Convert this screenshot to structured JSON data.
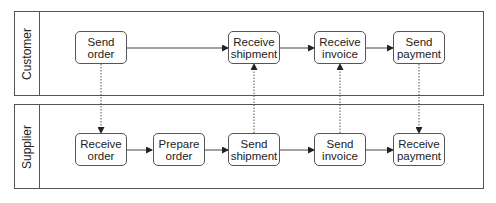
{
  "pools": [
    {
      "label": "Customer",
      "tasks": [
        {
          "line1": "Send",
          "line2": "order"
        },
        {
          "line1": "Receive",
          "line2": "shipment"
        },
        {
          "line1": "Receive",
          "line2": "invoice"
        },
        {
          "line1": "Send",
          "line2": "payment"
        }
      ]
    },
    {
      "label": "Supplier",
      "tasks": [
        {
          "line1": "Receive",
          "line2": "order"
        },
        {
          "line1": "Prepare",
          "line2": "order"
        },
        {
          "line1": "Send",
          "line2": "shipment"
        },
        {
          "line1": "Send",
          "line2": "invoice"
        },
        {
          "line1": "Receive",
          "line2": "payment"
        }
      ]
    }
  ],
  "sequence_flows": [
    {
      "from": "Send order",
      "to": "Receive shipment",
      "pool": "Customer"
    },
    {
      "from": "Receive shipment",
      "to": "Receive invoice",
      "pool": "Customer"
    },
    {
      "from": "Receive invoice",
      "to": "Send payment",
      "pool": "Customer"
    },
    {
      "from": "Receive order",
      "to": "Prepare order",
      "pool": "Supplier"
    },
    {
      "from": "Prepare order",
      "to": "Send shipment",
      "pool": "Supplier"
    },
    {
      "from": "Send shipment",
      "to": "Send invoice",
      "pool": "Supplier"
    },
    {
      "from": "Send invoice",
      "to": "Receive payment",
      "pool": "Supplier"
    }
  ],
  "message_flows": [
    {
      "from": "Send order",
      "to": "Receive order"
    },
    {
      "from": "Send shipment",
      "to": "Receive shipment"
    },
    {
      "from": "Send invoice",
      "to": "Receive invoice"
    },
    {
      "from": "Send payment",
      "to": "Receive payment"
    }
  ],
  "colors": {
    "stroke": "#555555",
    "text": "#222222",
    "background": "#ffffff"
  }
}
